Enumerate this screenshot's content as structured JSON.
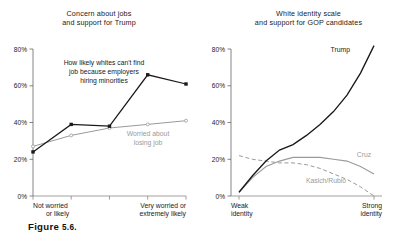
{
  "figure": {
    "caption": "Figure 5.6.",
    "caption_prefix": "Figure ",
    "caption_number": "5.6."
  },
  "chart_data": [
    {
      "type": "line",
      "panel": "left",
      "title": "Concern about jobs\nand support for Trump",
      "xlabel": "",
      "ylabel": "",
      "ylim": [
        0,
        80
      ],
      "yticks": [
        0,
        20,
        40,
        60,
        80
      ],
      "ytick_labels": [
        "0%",
        "20%",
        "40%",
        "60%",
        "80%"
      ],
      "grid": false,
      "legend": "inline-annotations",
      "categories": [
        "1",
        "2",
        "3",
        "4",
        "5"
      ],
      "xtick_labels": [
        "Not worried\nor likely",
        "",
        "",
        "",
        "Very worried or\nextremely likely"
      ],
      "xtick_label_left_line1": "Not worried",
      "xtick_label_left_line2": "or likely",
      "xtick_label_right_line1": "Very worried or",
      "xtick_label_right_line2": "extremely likely",
      "series": [
        {
          "name": "How likely whites can't find job because employers hiring minorities",
          "label_line1": "How likely whites can't find",
          "label_line2": "job because employers",
          "label_line3": "hiring minorities",
          "style": "solid",
          "color": "#1a1a1a",
          "marker": "square",
          "values": [
            24,
            39,
            38,
            66,
            61
          ]
        },
        {
          "name": "Worried about losing job",
          "label_line1": "Worried about",
          "label_line2": "losing job",
          "style": "solid",
          "color": "#9a9a9a",
          "marker": "circle",
          "values": [
            27,
            33,
            37,
            39,
            41
          ]
        }
      ]
    },
    {
      "type": "line",
      "panel": "right",
      "title": "White identity scale\nand support for GOP candidates",
      "xlabel": "",
      "ylabel": "",
      "ylim": [
        0,
        80
      ],
      "yticks": [
        0,
        20,
        40,
        60,
        80
      ],
      "ytick_labels": [
        "0%",
        "20%",
        "40%",
        "60%",
        "80%"
      ],
      "grid": false,
      "legend": "end-of-line-labels",
      "x": [
        0,
        0.1,
        0.2,
        0.3,
        0.4,
        0.5,
        0.6,
        0.7,
        0.8,
        0.9,
        1.0
      ],
      "xtick_labels": [
        "Weak\nidentity",
        "Strong\nidentity"
      ],
      "xtick_label_left_line1": "Weak",
      "xtick_label_left_line2": "identity",
      "xtick_label_right_line1": "Strong",
      "xtick_label_right_line2": "identity",
      "series": [
        {
          "name": "Trump",
          "style": "solid",
          "color": "#1a1a1a",
          "values": [
            2,
            11,
            19,
            25,
            28,
            33,
            39,
            46,
            55,
            67,
            82
          ]
        },
        {
          "name": "Cruz",
          "style": "solid",
          "color": "#9a9a9a",
          "values": [
            2,
            10,
            16,
            19,
            21,
            21,
            21,
            20,
            19,
            16,
            12
          ]
        },
        {
          "name": "Kasich/Rubio",
          "style": "dashed",
          "color": "#9a9a9a",
          "values": [
            22,
            20,
            19,
            18,
            18,
            17,
            15,
            12,
            9,
            5,
            0
          ]
        }
      ]
    }
  ]
}
